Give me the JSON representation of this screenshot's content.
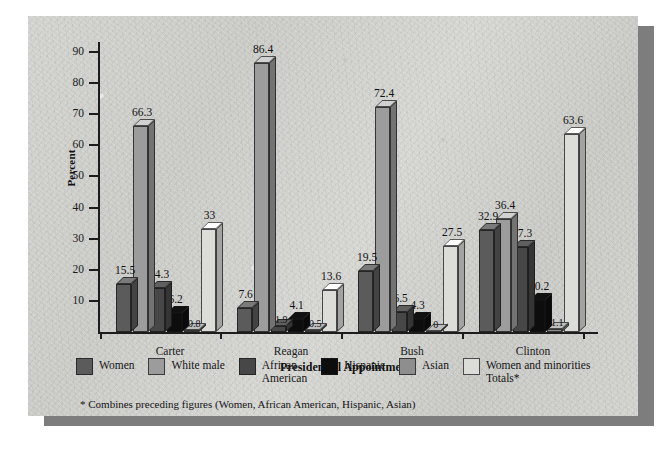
{
  "chart_data": {
    "type": "bar",
    "title": "",
    "xlabel": "Presidential Appointments",
    "ylabel": "Percent",
    "ylim": [
      0,
      90
    ],
    "yticks": [
      0,
      10,
      20,
      30,
      40,
      50,
      60,
      70,
      80,
      90
    ],
    "grid": false,
    "legend_position": "bottom",
    "categories": [
      "Carter",
      "Reagan",
      "Bush",
      "Clinton"
    ],
    "series": [
      {
        "name": "Women",
        "color": "#5b5b5b",
        "values": [
          15.5,
          7.6,
          19.5,
          32.9
        ],
        "labels": [
          "15.5",
          "7.6",
          "19.5",
          "32.9"
        ]
      },
      {
        "name": "White male",
        "color": "#9c9c9c",
        "values": [
          66.3,
          86.4,
          72.4,
          36.4
        ],
        "labels": [
          "66.3",
          "86.4",
          "72.4",
          "36.4"
        ]
      },
      {
        "name": "African\nAmerican",
        "color": "#474747",
        "values": [
          14.3,
          1.9,
          6.5,
          27.3
        ],
        "labels": [
          "14.3",
          "1.9",
          "6.5",
          "27.3"
        ]
      },
      {
        "name": "Hispanic",
        "color": "#0d0d0d",
        "values": [
          6.2,
          4.1,
          4.3,
          10.2
        ],
        "labels": [
          "6.2",
          "4.1",
          "4.3",
          "10.2"
        ]
      },
      {
        "name": "Asian",
        "color": "#8e8e8e",
        "values": [
          0.8,
          0.5,
          0,
          1.1
        ],
        "labels": [
          "0.8",
          "0.5",
          "0",
          "1.1"
        ]
      },
      {
        "name": "Women and minorities\nTotals*",
        "color": "#dcdcd9",
        "values": [
          33,
          13.6,
          27.5,
          63.6
        ],
        "labels": [
          "33",
          "13.6",
          "27.5",
          "63.6"
        ]
      }
    ],
    "footnote": "* Combines preceding figures (Women, African American, Hispanic, Asian)"
  }
}
